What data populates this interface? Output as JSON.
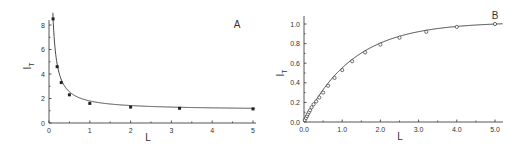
{
  "chart_data": [
    {
      "type": "line",
      "panel_label": "A",
      "xlabel": "L",
      "ylabel": "I",
      "ylabel_sub": "T",
      "xlim": [
        0,
        5
      ],
      "ylim": [
        0,
        8.5
      ],
      "xticks": [
        "0",
        "1",
        "2",
        "3",
        "4",
        "5"
      ],
      "yticks": [
        "0",
        "2",
        "4",
        "6",
        "8"
      ],
      "grid": false,
      "marker": "filled-square",
      "points": [
        {
          "x": 0.1,
          "y": 8.5
        },
        {
          "x": 0.2,
          "y": 4.6
        },
        {
          "x": 0.3,
          "y": 3.3
        },
        {
          "x": 0.5,
          "y": 2.3
        },
        {
          "x": 1.0,
          "y": 1.6
        },
        {
          "x": 2.0,
          "y": 1.3
        },
        {
          "x": 3.2,
          "y": 1.2
        },
        {
          "x": 5.0,
          "y": 1.15
        }
      ]
    },
    {
      "type": "line",
      "panel_label": "B",
      "xlabel": "L",
      "ylabel": "I",
      "ylabel_sub": "T",
      "xlim": [
        0,
        5.2
      ],
      "ylim": [
        0,
        1.05
      ],
      "xticks": [
        "0.0",
        "1.0",
        "2.0",
        "3.0",
        "4.0",
        "5.0"
      ],
      "yticks": [
        "0.0",
        "0.2",
        "0.4",
        "0.6",
        "0.8",
        "1.0"
      ],
      "grid": false,
      "marker": "open-circle",
      "points": [
        {
          "x": 0.02,
          "y": 0.02
        },
        {
          "x": 0.05,
          "y": 0.04
        },
        {
          "x": 0.08,
          "y": 0.06
        },
        {
          "x": 0.1,
          "y": 0.08
        },
        {
          "x": 0.13,
          "y": 0.1
        },
        {
          "x": 0.16,
          "y": 0.12
        },
        {
          "x": 0.2,
          "y": 0.15
        },
        {
          "x": 0.25,
          "y": 0.18
        },
        {
          "x": 0.32,
          "y": 0.21
        },
        {
          "x": 0.4,
          "y": 0.25
        },
        {
          "x": 0.5,
          "y": 0.3
        },
        {
          "x": 0.63,
          "y": 0.37
        },
        {
          "x": 0.8,
          "y": 0.45
        },
        {
          "x": 1.0,
          "y": 0.53
        },
        {
          "x": 1.26,
          "y": 0.62
        },
        {
          "x": 1.6,
          "y": 0.71
        },
        {
          "x": 2.0,
          "y": 0.79
        },
        {
          "x": 2.5,
          "y": 0.86
        },
        {
          "x": 3.2,
          "y": 0.92
        },
        {
          "x": 4.0,
          "y": 0.97
        },
        {
          "x": 5.0,
          "y": 1.0
        }
      ]
    }
  ]
}
